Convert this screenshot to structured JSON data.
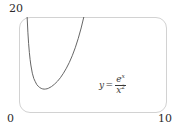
{
  "figure": {
    "name": "exponential-over-square-plot"
  },
  "annotation": {
    "lhs": "y",
    "equals": "=",
    "numerator_base": "e",
    "numerator_exponent": "x",
    "denominator_base": "x",
    "denominator_exponent": "2",
    "plain_text": "y = e^x / x^2"
  },
  "colors": {
    "frame": "#d2d2d2",
    "curve": "#555555",
    "text": "#2b2b2b"
  },
  "chart_data": {
    "type": "line",
    "title": "",
    "xlabel": "",
    "ylabel": "",
    "xlim": [
      0,
      10
    ],
    "ylim": [
      0,
      20
    ],
    "grid": false,
    "legend": null,
    "tick_labels": {
      "y_max": "20",
      "origin": "0",
      "x_max": "10"
    },
    "annotations": [
      {
        "text": "y = e^x / x^2",
        "x": 6.4,
        "y": 7.2
      }
    ],
    "series": [
      {
        "name": "y = e^x / x^2",
        "function": "exp(x)/x^2",
        "x": [
          0.55,
          0.6,
          0.65,
          0.7,
          0.75,
          0.8,
          0.9,
          1.0,
          1.1,
          1.2,
          1.3,
          1.4,
          1.5,
          1.6,
          1.7,
          1.8,
          1.9,
          2.0,
          2.2,
          2.4,
          2.6,
          2.8,
          3.0,
          3.2,
          3.4,
          3.6,
          3.8,
          4.0,
          4.2,
          4.4,
          4.6,
          4.8,
          5.0,
          5.2,
          5.4,
          5.6,
          5.8,
          6.0,
          6.2,
          6.4,
          6.6,
          6.8,
          7.0,
          7.2,
          7.4,
          7.6,
          7.75
        ],
        "y": [
          20.0,
          16.82,
          14.45,
          12.61,
          11.16,
          10.0,
          8.29,
          7.19,
          6.53,
          5.93,
          5.57,
          5.31,
          5.13,
          5.02,
          4.97,
          5.0,
          5.05,
          5.17,
          5.51,
          6.01,
          6.61,
          7.36,
          8.27,
          9.33,
          10.53,
          11.94,
          13.59,
          15.5,
          17.71,
          20.27,
          23.25,
          26.69,
          30.69,
          35.33,
          40.72,
          46.98,
          54.26,
          62.73,
          72.58,
          84.06,
          97.44,
          113.05,
          131.27,
          152.56,
          177.46,
          206.58,
          226.0
        ]
      }
    ]
  }
}
